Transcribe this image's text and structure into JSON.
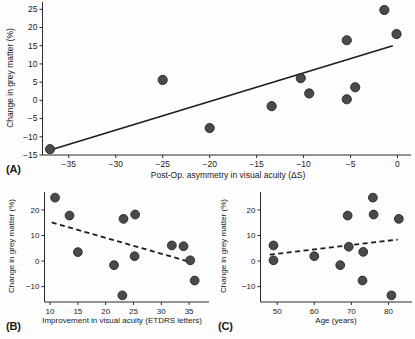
{
  "figure": {
    "panel_labels": {
      "a": "(A)",
      "b": "(B)",
      "c": "(C)"
    }
  },
  "chart_data": [
    {
      "panel": "A",
      "type": "scatter",
      "title": "",
      "xlabel": "Post-Op. asymmetry in visual acuity (ΔS)",
      "ylabel": "Change in grey matter (%)",
      "xlim": [
        -37.8,
        0.8
      ],
      "ylim": [
        -15,
        27
      ],
      "xticks": [
        -35,
        -30,
        -25,
        -20,
        -15,
        -10,
        -5,
        0
      ],
      "yticks": [
        -15,
        -10,
        -5,
        0,
        5,
        10,
        15,
        20,
        25
      ],
      "grid": false,
      "legend": "none",
      "points": [
        {
          "x": -37.0,
          "y": -13.4
        },
        {
          "x": -25.0,
          "y": 5.6
        },
        {
          "x": -20.0,
          "y": -7.6
        },
        {
          "x": -13.4,
          "y": -1.6
        },
        {
          "x": -10.3,
          "y": 6.1
        },
        {
          "x": -9.4,
          "y": 1.9
        },
        {
          "x": -5.4,
          "y": 0.3
        },
        {
          "x": -5.4,
          "y": 16.5
        },
        {
          "x": -4.5,
          "y": 3.6
        },
        {
          "x": -1.4,
          "y": 24.8
        },
        {
          "x": -0.1,
          "y": 18.2
        }
      ],
      "fit_line": {
        "style": "solid",
        "x1": -37.4,
        "y1": -14.0,
        "x2": -0.5,
        "y2": 15.0
      }
    },
    {
      "panel": "B",
      "type": "scatter",
      "title": "",
      "xlabel": "Improvement in visual acuity (ETDRS letters)",
      "ylabel": "Change in grey matter (%)",
      "xlim": [
        9.0,
        37.5
      ],
      "ylim": [
        -16,
        27
      ],
      "xticks": [
        10,
        15,
        20,
        25,
        30,
        35
      ],
      "yticks": [
        -10,
        0,
        10,
        20
      ],
      "grid": false,
      "legend": "none",
      "points": [
        {
          "x": 10.9,
          "y": 24.8
        },
        {
          "x": 13.5,
          "y": 17.8
        },
        {
          "x": 15.0,
          "y": 3.5
        },
        {
          "x": 21.5,
          "y": -1.6
        },
        {
          "x": 23.0,
          "y": -13.4
        },
        {
          "x": 23.2,
          "y": 16.5
        },
        {
          "x": 25.3,
          "y": 18.2
        },
        {
          "x": 25.2,
          "y": 1.9
        },
        {
          "x": 31.9,
          "y": 6.1
        },
        {
          "x": 34.0,
          "y": 5.8
        },
        {
          "x": 35.2,
          "y": 0.3
        },
        {
          "x": 36.0,
          "y": -7.6
        }
      ],
      "fit_line": {
        "style": "dashed",
        "x1": 10.3,
        "y1": 15.1,
        "x2": 35.6,
        "y2": -0.6
      }
    },
    {
      "panel": "C",
      "type": "scatter",
      "title": "",
      "xlabel": "Age (years)",
      "ylabel": "Change in grey matter (%)",
      "xlim": [
        45.5,
        85.0
      ],
      "ylim": [
        -16,
        27
      ],
      "xticks": [
        50,
        60,
        70,
        80
      ],
      "yticks": [
        -10,
        0,
        10,
        20
      ],
      "grid": false,
      "legend": "none",
      "points": [
        {
          "x": 49.0,
          "y": 6.1
        },
        {
          "x": 49.0,
          "y": 0.3
        },
        {
          "x": 60.0,
          "y": 1.9
        },
        {
          "x": 67.0,
          "y": -1.6
        },
        {
          "x": 69.0,
          "y": 17.8
        },
        {
          "x": 69.3,
          "y": 5.6
        },
        {
          "x": 73.0,
          "y": -7.6
        },
        {
          "x": 73.2,
          "y": 3.6
        },
        {
          "x": 75.8,
          "y": 24.8
        },
        {
          "x": 76.0,
          "y": 18.2
        },
        {
          "x": 80.8,
          "y": -13.4
        },
        {
          "x": 82.8,
          "y": 16.5
        }
      ],
      "fit_line": {
        "style": "dashed",
        "x1": 48.0,
        "y1": 2.5,
        "x2": 82.5,
        "y2": 8.4
      }
    }
  ]
}
